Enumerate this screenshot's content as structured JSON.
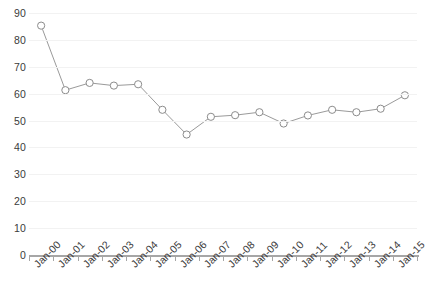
{
  "chart_data": {
    "type": "line",
    "title": "",
    "subtitle": "",
    "xlabel": "",
    "ylabel": "",
    "categories": [
      "Jan-00",
      "Jan-01",
      "Jan-02",
      "Jan-03",
      "Jan-04",
      "Jan-05",
      "Jan-06",
      "Jan-07",
      "Jan-08",
      "Jan-09",
      "Jan-10",
      "Jan-11",
      "Jan-12",
      "Jan-13",
      "Jan-14",
      "Jan-15"
    ],
    "values": [
      85.3,
      61.3,
      64.0,
      63.0,
      63.5,
      54.0,
      44.8,
      51.4,
      52.0,
      53.1,
      48.9,
      51.9,
      54.0,
      53.1,
      54.4,
      59.4
    ],
    "series": [
      {
        "name": "Series 1",
        "values": [
          85.3,
          61.3,
          64.0,
          63.0,
          63.5,
          54.0,
          44.8,
          51.4,
          52.0,
          53.1,
          48.9,
          51.9,
          54.0,
          53.1,
          54.4,
          59.4
        ]
      }
    ],
    "ylim": [
      0,
      90
    ],
    "ytick_values": [
      0,
      10,
      20,
      30,
      40,
      50,
      60,
      70,
      80,
      90
    ],
    "ytick_labels": [
      "0",
      "10",
      "20",
      "30",
      "40",
      "50",
      "60",
      "70",
      "80",
      "90"
    ],
    "grid": true,
    "grid_axis": "y",
    "legend": false,
    "legend_position": "none",
    "marker": "open-circle",
    "line_color": "#9a9a9a",
    "marker_fill": "#ffffff",
    "marker_stroke": "#8c8c8c",
    "gridline_color": "#f2f2f2",
    "axis_color": "#a6a6a6",
    "text_color": "#3b3b3b",
    "xtick_label_rotation": -45
  }
}
